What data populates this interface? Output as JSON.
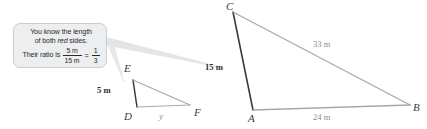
{
  "figure": {
    "callout": {
      "line1": "You know the length",
      "line2_before": "of both ",
      "line2_emphasis": "red",
      "line2_after": " sides.",
      "ratio_prefix": "Their ratio is",
      "fraction_left_numerator": "5 m",
      "fraction_left_denominator": "15 m",
      "equals_sign": "=",
      "fraction_right_numerator": "1",
      "fraction_right_denominator": "3"
    },
    "small_triangle": {
      "name": "triangle-def",
      "vertices": [
        {
          "label": "E",
          "x": 133,
          "y": 80
        },
        {
          "label": "D",
          "x": 137,
          "y": 107
        },
        {
          "label": "F",
          "x": 190,
          "y": 105
        }
      ],
      "side_labels": [
        {
          "name": "side-de-length",
          "text": "5 m",
          "x": 97,
          "y": 85
        },
        {
          "name": "side-df-length",
          "text": "y",
          "x": 159,
          "y": 111
        }
      ]
    },
    "large_triangle": {
      "name": "triangle-abc",
      "vertices": [
        {
          "label": "C",
          "x": 233,
          "y": 12
        },
        {
          "label": "A",
          "x": 253,
          "y": 110
        },
        {
          "label": "B",
          "x": 410,
          "y": 105
        }
      ],
      "side_labels": [
        {
          "name": "side-ac-length",
          "text": "15 m",
          "x": 205,
          "y": 62
        },
        {
          "name": "side-cb-length",
          "text": "33 m",
          "x": 313,
          "y": 39
        },
        {
          "name": "side-ab-length",
          "text": "24 m",
          "x": 313,
          "y": 112
        }
      ]
    },
    "colors": {
      "red_side": "#3a3a3a",
      "gray_side": "#a8a8a8",
      "callout_fill": "#eceef0",
      "callout_border": "#c9ced3",
      "text": "#2a2a2a"
    },
    "vertex_label_positions": {
      "E": {
        "x": 124,
        "y": 62
      },
      "D": {
        "x": 124,
        "y": 110
      },
      "F": {
        "x": 194,
        "y": 106
      },
      "C": {
        "x": 226,
        "y": 0
      },
      "A": {
        "x": 248,
        "y": 112
      },
      "B": {
        "x": 413,
        "y": 101
      }
    }
  }
}
